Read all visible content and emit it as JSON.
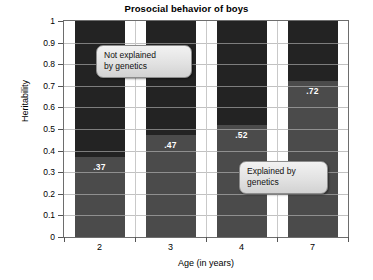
{
  "chart_data": {
    "type": "bar",
    "subtype": "stacked-bar",
    "title": "Prosocial behavior of boys",
    "xlabel": "Age (in years)",
    "ylabel": "Heritability",
    "categories": [
      "2",
      "3",
      "4",
      "7"
    ],
    "ylim": [
      0,
      1
    ],
    "ytick_labels": [
      "1",
      "0.9",
      "0.8",
      "0.7",
      "0.6",
      "0.5",
      "0.4",
      "0.3",
      "0.2",
      "0.1",
      "0"
    ],
    "ytick_values": [
      1,
      0.9,
      0.8,
      0.7,
      0.6,
      0.5,
      0.4,
      0.3,
      0.2,
      0.1,
      0
    ],
    "grid": true,
    "legend_position": "none",
    "series": [
      {
        "name": "Explained by genetics",
        "color": "#4b4b4b",
        "values": [
          0.37,
          0.47,
          0.52,
          0.72
        ],
        "data_labels": [
          ".37",
          ".47",
          ".52",
          ".72"
        ]
      },
      {
        "name": "Not explained by genetics",
        "color": "#232323",
        "values": [
          0.63,
          0.53,
          0.48,
          0.28
        ],
        "data_labels": [
          "",
          "",
          "",
          ""
        ]
      }
    ],
    "annotations": [
      {
        "id": "not-explained",
        "text": "Not explained\nby genetics"
      },
      {
        "id": "explained",
        "text": "Explained by\ngenetics"
      }
    ]
  },
  "colors": {
    "explained": "#4b4b4b",
    "not_explained": "#232323",
    "axis": "#6d6d6d",
    "grid": "#b9b9b9",
    "background": "#ffffff",
    "callout_border": "#8c8c8c"
  }
}
